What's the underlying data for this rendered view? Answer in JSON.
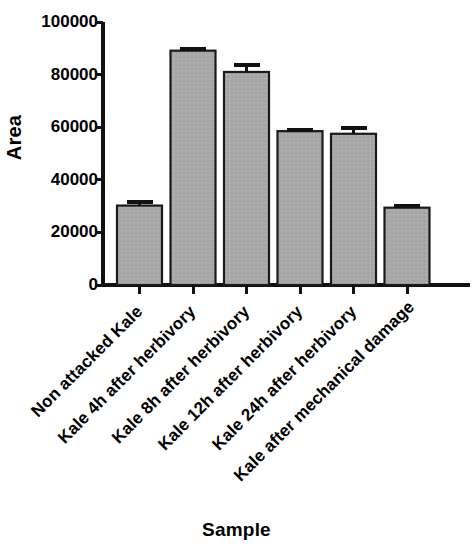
{
  "chart_data": {
    "type": "bar",
    "title": "",
    "xlabel": "Sample",
    "ylabel": "Area",
    "categories": [
      "Non attacked Kale",
      "Kale 4h after herbivory",
      "Kale 8h after herbivory",
      "Kale 12h after herbivory",
      "Kale 24h after herbivory",
      "Kale after mechanical damage"
    ],
    "values": [
      30200,
      89100,
      81000,
      58500,
      57500,
      29400
    ],
    "errors": [
      1200,
      800,
      2500,
      500,
      2200,
      600
    ],
    "ylim": [
      0,
      100000
    ],
    "yticks": [
      0,
      20000,
      40000,
      60000,
      80000,
      100000
    ],
    "ytick_labels": [
      "0",
      "20000",
      "40000",
      "60000",
      "80000",
      "100000"
    ],
    "grid": false,
    "legend": null,
    "bar_color": "#a8a8a8",
    "bar_edge_color": "#1a1a1a",
    "error_bar_color": "#111111",
    "axis_color": "#111111",
    "background_color": "#ffffff"
  },
  "axes": {
    "y_title": "Area",
    "x_title": "Sample"
  }
}
